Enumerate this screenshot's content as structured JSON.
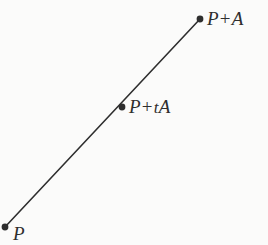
{
  "figure": {
    "type": "geometry-diagram",
    "width": 268,
    "height": 245,
    "background_color": "#fbfbfa",
    "ink_color": "#2e2e2e"
  },
  "geometry": {
    "segment": {
      "name": "line-segment",
      "start": {
        "x": 5,
        "y": 227
      },
      "end": {
        "x": 200,
        "y": 19
      },
      "stroke_color": "#2e2e2e",
      "stroke_width": 1.6
    },
    "points": [
      {
        "id": "p",
        "label_text": "P",
        "label_parts": {
          "base": "P",
          "operator": "",
          "scalar": "",
          "vector": ""
        },
        "x": 5,
        "y": 227,
        "radius": 3.4,
        "fill": "#2e2e2e"
      },
      {
        "id": "p-plus-ta",
        "label_text": "P + tA",
        "label_parts": {
          "base": "P",
          "operator": "+",
          "scalar": "t",
          "vector": "A"
        },
        "x": 122,
        "y": 107,
        "radius": 3.4,
        "fill": "#2e2e2e"
      },
      {
        "id": "p-plus-a",
        "label_text": "P + A",
        "label_parts": {
          "base": "P",
          "operator": "+",
          "scalar": "",
          "vector": "A"
        },
        "x": 200,
        "y": 19,
        "radius": 3.4,
        "fill": "#2e2e2e"
      }
    ]
  },
  "labels": {
    "p": {
      "base": "P"
    },
    "p_plus_ta": {
      "base": "P",
      "operator": "+",
      "scalar": "t",
      "vector": "A"
    },
    "p_plus_a": {
      "base": "P",
      "operator": "+",
      "vector": "A"
    }
  }
}
